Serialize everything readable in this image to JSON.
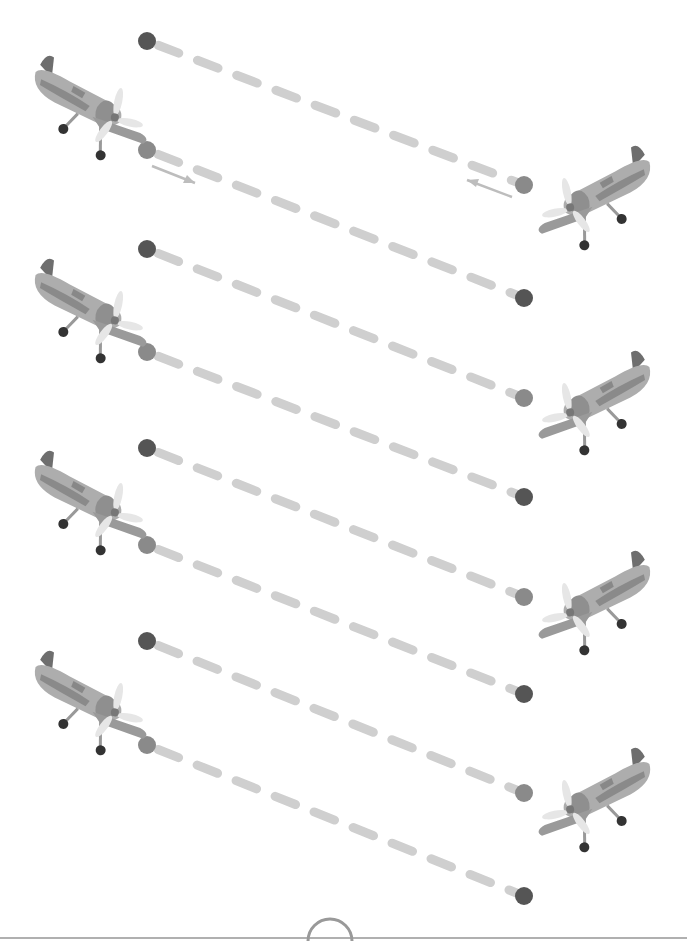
{
  "worksheet": {
    "type": "line-tracing",
    "colors": {
      "dash": "#cfcfcf",
      "dot_dark": "#555555",
      "dot_light": "#8a8a8a",
      "arrow": "#bdbdbd",
      "plane_body": "#a9a9a9",
      "plane_dark": "#7a7a7a",
      "propeller": "#e6e6e6",
      "wheel": "#333333",
      "footer_line": "#9a9a9a"
    },
    "left_planes": [
      {
        "x": 95,
        "y": 105
      },
      {
        "x": 95,
        "y": 308
      },
      {
        "x": 95,
        "y": 500
      },
      {
        "x": 95,
        "y": 700
      }
    ],
    "right_planes": [
      {
        "x": 590,
        "y": 195
      },
      {
        "x": 590,
        "y": 400
      },
      {
        "x": 590,
        "y": 600
      },
      {
        "x": 590,
        "y": 797
      }
    ],
    "lines": [
      {
        "x1": 147,
        "y1": 41,
        "x2": 524,
        "y2": 185,
        "start": "dark",
        "end": "light",
        "arrow": "left"
      },
      {
        "x1": 147,
        "y1": 150,
        "x2": 524,
        "y2": 298,
        "start": "light",
        "end": "dark",
        "arrow": "right"
      },
      {
        "x1": 147,
        "y1": 249,
        "x2": 524,
        "y2": 398,
        "start": "dark",
        "end": "light"
      },
      {
        "x1": 147,
        "y1": 352,
        "x2": 524,
        "y2": 497,
        "start": "light",
        "end": "dark"
      },
      {
        "x1": 147,
        "y1": 448,
        "x2": 524,
        "y2": 597,
        "start": "dark",
        "end": "light"
      },
      {
        "x1": 147,
        "y1": 545,
        "x2": 524,
        "y2": 694,
        "start": "light",
        "end": "dark"
      },
      {
        "x1": 147,
        "y1": 641,
        "x2": 524,
        "y2": 793,
        "start": "dark",
        "end": "light"
      },
      {
        "x1": 147,
        "y1": 745,
        "x2": 524,
        "y2": 896,
        "start": "light",
        "end": "dark"
      }
    ]
  }
}
